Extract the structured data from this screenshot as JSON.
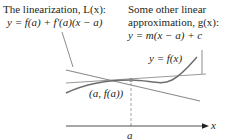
{
  "diagram": {
    "linearization_label": {
      "title": "The linearization, L(x):",
      "equation": "y = f(a) + f′(a)(x − a)"
    },
    "other_approx_label": {
      "line1": "Some other linear",
      "line2": "approximation, g(x):",
      "equation": "y = m(x − a) + c"
    },
    "curve_label": "y = f(x)",
    "point_label": "(a, f(a))",
    "x_tick_label": "a",
    "x_axis_label": "x",
    "colors": {
      "curve": "#6d6e71",
      "lines": "#8a8a8a",
      "text": "#231f20",
      "point": "#8a8a8a"
    }
  }
}
